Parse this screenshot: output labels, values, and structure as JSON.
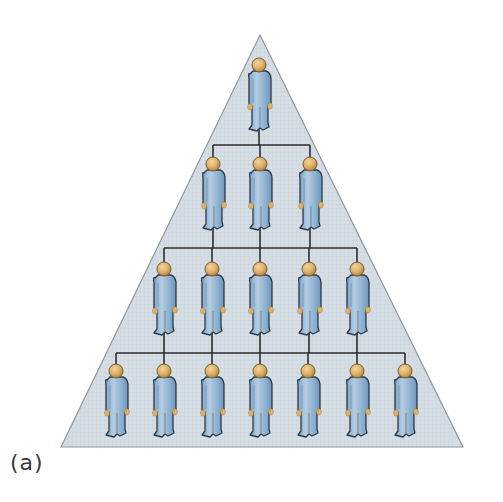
{
  "figure": {
    "caption": "(a)",
    "colors": {
      "pyramid_fill": "#d3dbe3",
      "pyramid_stroke": "#8e969e",
      "connector": "#2c2c2c",
      "body_fill": "#8fb1cf",
      "body_highlight": "#b4cde2",
      "body_shadow": "#6f95b8",
      "head_fill": "#e0b36a",
      "head_shadow": "#b9863d",
      "outline": "#2a3a4a"
    },
    "pyramid": {
      "apex": [
        260,
        35
      ],
      "base_left": [
        61,
        447
      ],
      "base_right": [
        463,
        447
      ]
    },
    "levels": [
      {
        "name": "level-1",
        "count": 1,
        "head_top": 58,
        "x": [
          259
        ]
      },
      {
        "name": "level-2",
        "count": 3,
        "head_top": 157,
        "bar_y": 145,
        "x": [
          213,
          260,
          310
        ]
      },
      {
        "name": "level-3",
        "count": 5,
        "head_top": 262,
        "bar_y": 248,
        "x": [
          164,
          212,
          260,
          309,
          357
        ]
      },
      {
        "name": "level-4",
        "count": 7,
        "head_top": 364,
        "bar_y": 353,
        "x": [
          116,
          164,
          212,
          260,
          308,
          357,
          405
        ]
      }
    ]
  }
}
